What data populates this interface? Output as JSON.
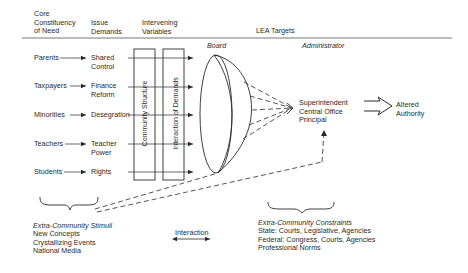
{
  "headers": {
    "core_constituency": "Core\nConstituency\nof Need",
    "issue_demands": "Issue\nDemands",
    "intervening_variables": "Intervening\nVariables",
    "lea_targets": "LEA Targets",
    "board": "Board",
    "administrator": "Administrator"
  },
  "rows": [
    {
      "constituency": "Parents",
      "demand": "Shared\nControl"
    },
    {
      "constituency": "Taxpayers",
      "demand": "Finance\nReform"
    },
    {
      "constituency": "Minorities",
      "demand": "Desegration"
    },
    {
      "constituency": "Teachers",
      "demand": "Teacher\nPower"
    },
    {
      "constituency": "Students",
      "demand": "Rights"
    }
  ],
  "intervening": {
    "community_structure": "Community Structure",
    "interaction_of_demands": "Interaction of Demands"
  },
  "administrator_targets": "Superintendent\nCentral Office\nPrincipal",
  "outcome": "Altered\nAuthority",
  "stimuli": {
    "title": "Extra-Community Stimuli",
    "items": "New Concepts\nCrystallizing Events\nNational Media"
  },
  "constraints": {
    "title": "Extra-Community Constraints",
    "items": "State: Courts, Legislative, Agencies\nFederal: Congress, Courts, Agencies\nProfessional Norms"
  },
  "legend": {
    "interaction": "Interaction"
  }
}
